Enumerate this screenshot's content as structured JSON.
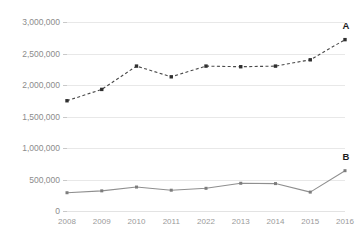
{
  "chart_data": {
    "type": "line",
    "title": "",
    "xlabel": "",
    "ylabel": "",
    "categories": [
      "2008",
      "2009",
      "2010",
      "2011",
      "2022",
      "2013",
      "2014",
      "2015",
      "2016"
    ],
    "ylim": [
      0,
      3000000
    ],
    "yticks": [
      0,
      500000,
      1000000,
      1500000,
      2000000,
      2500000,
      3000000
    ],
    "ytick_labels": [
      "0",
      "500,000",
      "1,000,000",
      "1,500,000",
      "2,000,000",
      "2,500,000",
      "3,000,000"
    ],
    "grid": true,
    "legend_position": "inline-end-of-line",
    "series": [
      {
        "name": "A",
        "style": "dashed",
        "color": "#4a4a4a",
        "marker": "square",
        "label": "A",
        "values": [
          1750000,
          1930000,
          2300000,
          2130000,
          2300000,
          2290000,
          2300000,
          2400000,
          2720000
        ]
      },
      {
        "name": "B",
        "style": "solid",
        "color": "#8f8f8f",
        "marker": "square",
        "label": "B",
        "values": [
          290000,
          320000,
          380000,
          330000,
          360000,
          440000,
          435000,
          300000,
          640000
        ]
      }
    ]
  },
  "colors": {
    "background": "#ffffff",
    "gridline": "#e8e8e8",
    "axis_text": "#8c8c8c",
    "series_a": "#4a4a4a",
    "series_b": "#8f8f8f",
    "series_label": "#1c1c1c"
  }
}
